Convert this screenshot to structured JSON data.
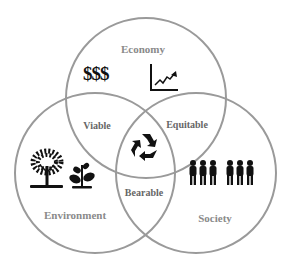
{
  "diagram": {
    "circles": [
      {
        "id": "economy",
        "label": "Economy",
        "icons": [
          "dollar-signs",
          "growth-chart"
        ],
        "symbol_text": "$$$"
      },
      {
        "id": "environment",
        "label": "Environment",
        "icons": [
          "tree",
          "sprout"
        ]
      },
      {
        "id": "society",
        "label": "Society",
        "icons": [
          "people-group"
        ]
      }
    ],
    "intersections": [
      {
        "between": [
          "economy",
          "environment"
        ],
        "label": "Viable"
      },
      {
        "between": [
          "economy",
          "society"
        ],
        "label": "Equitable"
      },
      {
        "between": [
          "environment",
          "society"
        ],
        "label": "Bearable"
      },
      {
        "between": [
          "economy",
          "environment",
          "society"
        ],
        "label": "",
        "icon": "recycle"
      }
    ],
    "colors": {
      "circle_stroke": "#9a9a9a",
      "icon": "#111111",
      "label": "#8a8a8a"
    }
  }
}
